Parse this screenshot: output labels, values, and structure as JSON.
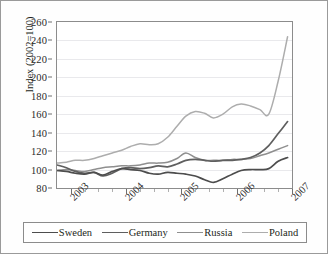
{
  "chart_data": {
    "type": "line",
    "title": "",
    "xlabel": "",
    "ylabel": "Index (2002=100)",
    "ylim": [
      80,
      260
    ],
    "ytick_step": 20,
    "yticks": [
      80,
      100,
      120,
      140,
      160,
      180,
      200,
      220,
      240,
      260
    ],
    "ytick_labels": [
      "80",
      "100",
      "120",
      "140",
      "160",
      "180",
      "200",
      "220",
      "240",
      "260"
    ],
    "xlim": [
      2002.75,
      2007.0
    ],
    "xticks": [
      2003,
      2004,
      2005,
      2006,
      2007
    ],
    "xtick_labels": [
      "2003",
      "2004",
      "2005",
      "2006",
      "2007"
    ],
    "xtick_rotation": -45,
    "minor_xticks_per_year": 4,
    "grid": "horizontal",
    "legend_position": "bottom",
    "x": [
      2002.75,
      2002.92,
      2003.08,
      2003.25,
      2003.42,
      2003.58,
      2003.75,
      2003.92,
      2004.08,
      2004.25,
      2004.42,
      2004.58,
      2004.75,
      2004.92,
      2005.08,
      2005.25,
      2005.42,
      2005.58,
      2005.75,
      2005.92,
      2006.08,
      2006.25,
      2006.42,
      2006.58,
      2006.75,
      2006.92
    ],
    "series": [
      {
        "name": "Sweden",
        "color": "#4d4d4d",
        "width": 1.7,
        "values": [
          99,
          98,
          96,
          95,
          97,
          94,
          98,
          101,
          100,
          99,
          96,
          95,
          97,
          96,
          95,
          93,
          89,
          86,
          90,
          95,
          99,
          100,
          100,
          101,
          109,
          113
        ]
      },
      {
        "name": "Germany",
        "color": "#5f5f5f",
        "width": 1.7,
        "values": [
          105,
          102,
          98,
          96,
          97,
          93,
          96,
          101,
          102,
          101,
          102,
          104,
          103,
          106,
          110,
          111,
          110,
          109,
          110,
          110,
          111,
          113,
          118,
          126,
          139,
          152
        ]
      },
      {
        "name": "Russia",
        "color": "#8f8f8f",
        "width": 1.5,
        "values": [
          99,
          100,
          99,
          98,
          100,
          102,
          103,
          104,
          104,
          105,
          107,
          107,
          108,
          112,
          118,
          113,
          110,
          110,
          110,
          111,
          111,
          112,
          115,
          118,
          122,
          126
        ]
      },
      {
        "name": "Poland",
        "color": "#adadad",
        "width": 1.5,
        "values": [
          107,
          108,
          110,
          110,
          112,
          115,
          118,
          121,
          125,
          128,
          127,
          128,
          135,
          147,
          158,
          163,
          161,
          156,
          160,
          168,
          171,
          169,
          165,
          160,
          196,
          244
        ]
      }
    ]
  },
  "legend": {
    "items": [
      {
        "label": "Sweden"
      },
      {
        "label": "Germany"
      },
      {
        "label": "Russia"
      },
      {
        "label": "Poland"
      }
    ]
  }
}
